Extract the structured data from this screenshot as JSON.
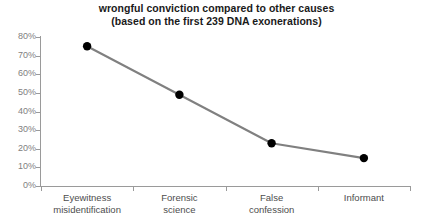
{
  "chart_data": {
    "type": "line",
    "title": "wrongful conviction compared to other causes",
    "subtitle": "(based on the first 239 DNA exonerations)",
    "categories": [
      "Eyewitness misidentification",
      "Forensic science",
      "False confession",
      "Informant"
    ],
    "category_lines": [
      [
        "Eyewitness",
        "misidentification"
      ],
      [
        "Forensic",
        "science"
      ],
      [
        "False",
        "confession"
      ],
      [
        "Informant"
      ]
    ],
    "values": [
      75,
      49,
      23,
      15
    ],
    "value_labels": [
      "75%",
      "49%",
      "23%",
      "15%"
    ],
    "xlabel": "",
    "ylabel": "",
    "ylim": [
      0,
      80
    ],
    "ytick_values": [
      80,
      70,
      60,
      50,
      40,
      30,
      20,
      10,
      0
    ],
    "ytick_labels": [
      "80%",
      "70%",
      "60%",
      "50%",
      "40%",
      "30%",
      "20%",
      "10%",
      "0%"
    ],
    "grid": false,
    "legend": false,
    "legend_position": "none",
    "colors": {
      "line": "#808080",
      "marker": "#000000",
      "axis": "#9a9a9a",
      "ytick_label": "#808080",
      "xtick_label": "#4d4d4d",
      "title": "#1a1a1a",
      "background": "#ffffff"
    }
  }
}
